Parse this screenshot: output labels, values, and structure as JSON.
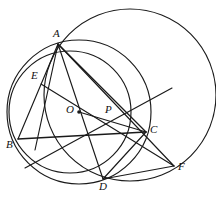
{
  "figure": {
    "kind": "geometry-diagram",
    "caption": "",
    "canvas": {
      "width": 216,
      "height": 206
    },
    "stroke_color": "#1a1a1a",
    "background_color": "#ffffff",
    "labels": {
      "A": "A",
      "B": "B",
      "C": "C",
      "D": "D",
      "E": "E",
      "F": "F",
      "O": "O",
      "P": "P"
    },
    "points": [
      {
        "id": "A",
        "label": "A",
        "x": 58,
        "y": 44,
        "label_x": 53,
        "label_y": 28
      },
      {
        "id": "B",
        "label": "B",
        "x": 18,
        "y": 139,
        "label_x": 8,
        "label_y": 139
      },
      {
        "id": "C",
        "label": "C",
        "x": 146,
        "y": 132,
        "label_x": 150,
        "label_y": 126
      },
      {
        "id": "D",
        "label": "D",
        "x": 103,
        "y": 179,
        "label_x": 98,
        "label_y": 181
      },
      {
        "id": "E",
        "label": "E",
        "x": 41,
        "y": 84,
        "label_x": 32,
        "label_y": 72
      },
      {
        "id": "F",
        "label": "F",
        "x": 174,
        "y": 166,
        "label_x": 178,
        "label_y": 163
      },
      {
        "id": "O",
        "label": "O",
        "x": 79,
        "y": 112,
        "label_x": 67,
        "label_y": 106
      },
      {
        "id": "P",
        "label": "P",
        "x": 110,
        "y": 117,
        "label_x": 106,
        "label_y": 106
      }
    ],
    "circles": [
      {
        "id": "small-circle",
        "cx": 70,
        "cy": 112,
        "r": 61
      },
      {
        "id": "medium-circle",
        "cx": 79,
        "cy": 112,
        "r": 72
      },
      {
        "id": "large-circle",
        "cx": 130,
        "cy": 95,
        "r": 86
      }
    ],
    "segments": [
      {
        "id": "A-B",
        "x1": 58,
        "y1": 44,
        "x2": 18,
        "y2": 139
      },
      {
        "id": "A-D",
        "x1": 58,
        "y1": 44,
        "x2": 103,
        "y2": 179
      },
      {
        "id": "A-C",
        "x1": 58,
        "y1": 44,
        "x2": 146,
        "y2": 132
      },
      {
        "id": "A-F",
        "x1": 58,
        "y1": 44,
        "x2": 174,
        "y2": 166
      },
      {
        "id": "A-E-extended",
        "x1": 58,
        "y1": 44,
        "x2": 35,
        "y2": 150
      },
      {
        "id": "B-C",
        "x1": 18,
        "y1": 139,
        "x2": 146,
        "y2": 132
      },
      {
        "id": "E-F",
        "x1": 41,
        "y1": 84,
        "x2": 174,
        "y2": 166
      },
      {
        "id": "D-C-F",
        "x1": 103,
        "y1": 179,
        "x2": 174,
        "y2": 166
      },
      {
        "id": "D-P-upper",
        "x1": 103,
        "y1": 179,
        "x2": 146,
        "y2": 132
      },
      {
        "id": "lower-left-to-upper-right",
        "x1": 25,
        "y1": 168,
        "x2": 172,
        "y2": 88
      },
      {
        "id": "O-P-ray",
        "x1": 79,
        "y1": 112,
        "x2": 146,
        "y2": 132
      }
    ]
  }
}
